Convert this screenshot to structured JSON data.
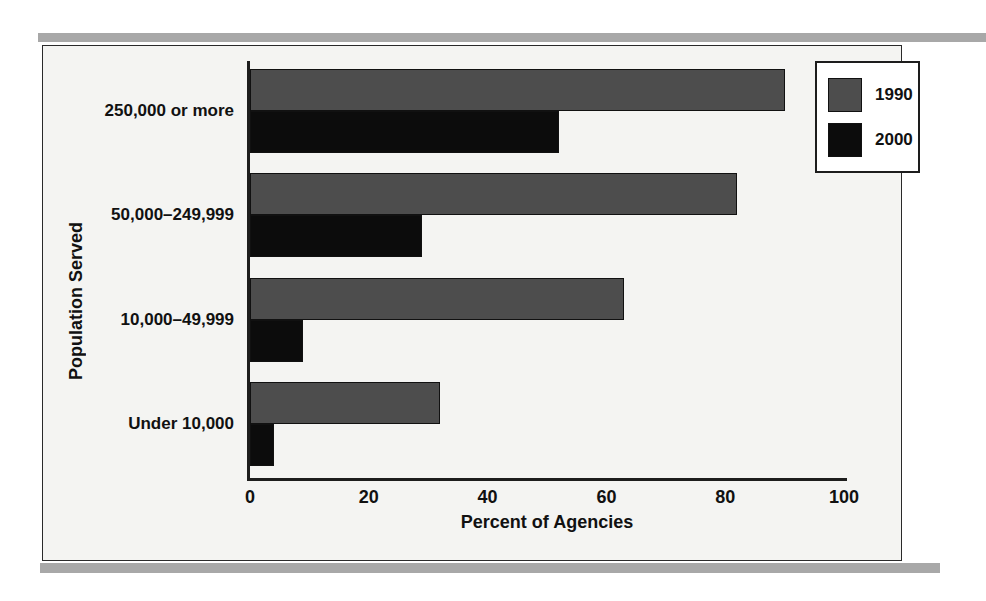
{
  "chart_data": {
    "type": "bar",
    "orientation": "horizontal",
    "title": "",
    "xlabel": "Percent of Agencies",
    "ylabel": "Population Served",
    "categories": [
      "250,000 or more",
      "50,000–249,999",
      "10,000–49,999",
      "Under 10,000"
    ],
    "series": [
      {
        "name": "1990",
        "color": "#4d4d4d",
        "values": [
          90,
          82,
          63,
          32
        ]
      },
      {
        "name": "2000",
        "color": "#0c0c0c",
        "values": [
          52,
          29,
          9,
          4
        ]
      }
    ],
    "xlim": [
      0,
      100
    ],
    "xticks": [
      "0",
      "20",
      "40",
      "60",
      "80",
      "100"
    ],
    "grid": false,
    "legend_position": "top-right"
  },
  "legend": {
    "entries": [
      {
        "label": "1990",
        "color": "#4d4d4d"
      },
      {
        "label": "2000",
        "color": "#0c0c0c"
      }
    ]
  },
  "colors": {
    "series_1990": "#4d4d4d",
    "series_2000": "#0c0c0c",
    "band": "#a8a8a8",
    "panel_background": "#f4f4f2",
    "axis": "#1d1d1d"
  }
}
